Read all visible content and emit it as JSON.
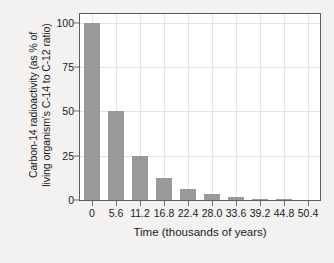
{
  "chart_data": {
    "type": "bar",
    "title": "",
    "subtitle": "",
    "xlabel": "Time (thousands of years)",
    "ylabel_line1": "Carbon-14 radioactivity (as % of",
    "ylabel_line2": "living organism's C-14 to C-12 ratio)",
    "ylabel": "Carbon-14 radioactivity (as % of living organism's C-14 to C-12 ratio)",
    "categories": [
      "0",
      "5.6",
      "11.2",
      "16.8",
      "22.4",
      "28.0",
      "33.6",
      "39.2",
      "44.8",
      "50.4"
    ],
    "x": [
      0,
      5.6,
      11.2,
      16.8,
      22.4,
      28.0,
      33.6,
      39.2,
      44.8,
      50.4
    ],
    "values": [
      100,
      50,
      25,
      12.5,
      6.25,
      3.13,
      1.56,
      0.78,
      0.39,
      0.2
    ],
    "xlim": [
      -2.8,
      53.2
    ],
    "ylim": [
      0,
      105
    ],
    "yticks": [
      0,
      25,
      50,
      75,
      100
    ],
    "ytick_labels": [
      "0",
      "25",
      "50",
      "75",
      "100"
    ],
    "xtick_labels": [
      "0",
      "5.6",
      "11.2",
      "16.8",
      "22.4",
      "28.0",
      "33.6",
      "39.2",
      "44.8",
      "50.4"
    ],
    "grid": true,
    "legend": "none",
    "bar_color": "#999999",
    "grid_color": "#e3e3e3",
    "frame_color": "#5c5c5c",
    "plot_background": "#ffffff",
    "figure_background": "#f4f2f0"
  }
}
